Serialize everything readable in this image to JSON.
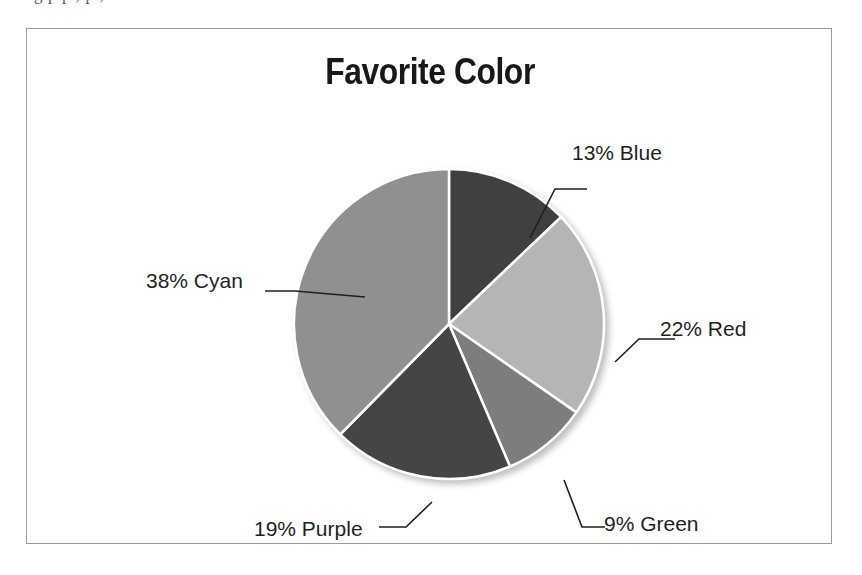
{
  "page": {
    "background_color": "#ffffff",
    "cut_off_text_above": "g  p  p  ,  p ,"
  },
  "frame": {
    "border_color": "#9a9a9a",
    "background_color": "#ffffff"
  },
  "chart_data": {
    "type": "pie",
    "title": "Favorite Color",
    "xlabel": "",
    "ylabel": "",
    "legend_position": "none",
    "labels_style": "outside-with-leader-lines",
    "categories": [
      "Blue",
      "Red",
      "Green",
      "Purple",
      "Cyan"
    ],
    "values": [
      13,
      22,
      9,
      19,
      38
    ],
    "value_unit": "%",
    "start_angle_deg": 0,
    "direction": "clockwise",
    "data_labels": [
      "13% Blue",
      "22% Red",
      "9% Green",
      "19% Purple",
      "38% Cyan"
    ],
    "slice_colors": [
      "#3f3f3f",
      "#b5b5b5",
      "#7d7d7d",
      "#454545",
      "#909090"
    ],
    "slice_border_color": "#ffffff",
    "slices": [
      {
        "label": "Blue",
        "value": 13,
        "display": "13% Blue",
        "color": "#3f3f3f"
      },
      {
        "label": "Red",
        "value": 22,
        "display": "22% Red",
        "color": "#b5b5b5"
      },
      {
        "label": "Green",
        "value": 9,
        "display": "9% Green",
        "color": "#7d7d7d"
      },
      {
        "label": "Purple",
        "value": 19,
        "display": "19% Purple",
        "color": "#454545"
      },
      {
        "label": "Cyan",
        "value": 38,
        "display": "38% Cyan",
        "color": "#909090"
      }
    ]
  }
}
